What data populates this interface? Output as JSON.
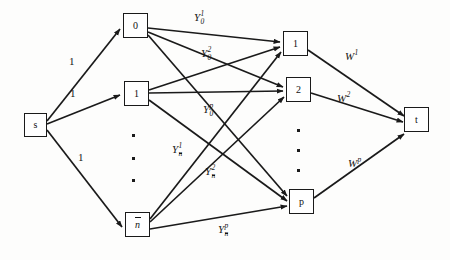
{
  "diagram": {
    "type": "flow-network-graph",
    "title": "",
    "canvas": {
      "width": 450,
      "height": 260
    },
    "stroke_color": "#1a1a1a",
    "background_color": "#fdfdfc",
    "nodes": [
      {
        "id": "s",
        "label": "s",
        "style": "upright",
        "overbar": false,
        "x": 24,
        "y": 113,
        "w": 23,
        "h": 24,
        "column": "source"
      },
      {
        "id": "m0",
        "label": "0",
        "style": "upright",
        "overbar": false,
        "x": 123,
        "y": 13,
        "w": 25,
        "h": 25,
        "column": "middle"
      },
      {
        "id": "m1",
        "label": "1",
        "style": "upright",
        "overbar": false,
        "x": 124,
        "y": 81,
        "w": 25,
        "h": 25,
        "column": "middle"
      },
      {
        "id": "mn",
        "label": "n",
        "style": "italic",
        "overbar": true,
        "x": 125,
        "y": 212,
        "w": 25,
        "h": 25,
        "column": "middle"
      },
      {
        "id": "r1",
        "label": "1",
        "style": "upright",
        "overbar": false,
        "x": 283,
        "y": 31,
        "w": 25,
        "h": 25,
        "column": "right"
      },
      {
        "id": "r2",
        "label": "2",
        "style": "upright",
        "overbar": false,
        "x": 286,
        "y": 77,
        "w": 25,
        "h": 25,
        "column": "right"
      },
      {
        "id": "rp",
        "label": "p",
        "style": "upright",
        "overbar": false,
        "x": 289,
        "y": 189,
        "w": 25,
        "h": 25,
        "column": "right"
      },
      {
        "id": "t",
        "label": "t",
        "style": "upright",
        "overbar": false,
        "x": 404,
        "y": 107,
        "w": 25,
        "h": 25,
        "column": "sink"
      }
    ],
    "source_edge_labels": [
      {
        "text": "1",
        "x": 69,
        "y": 56
      },
      {
        "text": "1",
        "x": 70,
        "y": 88
      },
      {
        "text": "1",
        "x": 78,
        "y": 152
      }
    ],
    "middle_edge_labels": [
      {
        "base": "Y",
        "sub": "0",
        "sub_overbar": false,
        "sup": "1",
        "x": 194,
        "y": 12
      },
      {
        "base": "Y",
        "sub": "0",
        "sub_overbar": false,
        "sup": "2",
        "x": 201,
        "y": 48
      },
      {
        "base": "Y",
        "sub": "0",
        "sub_overbar": false,
        "sup": "p",
        "x": 203,
        "y": 104
      },
      {
        "base": "Y",
        "sub": "n",
        "sub_overbar": true,
        "sup": "1",
        "x": 172,
        "y": 144
      },
      {
        "base": "Y",
        "sub": "n",
        "sub_overbar": true,
        "sup": "2",
        "x": 205,
        "y": 166
      },
      {
        "base": "Y",
        "sub": "n",
        "sub_overbar": true,
        "sup": "p",
        "x": 218,
        "y": 224
      }
    ],
    "sink_edge_labels": [
      {
        "base": "W",
        "sup": "1",
        "x": 345,
        "y": 51
      },
      {
        "base": "W",
        "sup": "2",
        "x": 337,
        "y": 93
      },
      {
        "base": "W",
        "sup": "p",
        "x": 348,
        "y": 158
      }
    ],
    "ellipsis_middle": [
      {
        "x": 132,
        "y": 134
      },
      {
        "x": 132,
        "y": 157
      },
      {
        "x": 132,
        "y": 179
      }
    ],
    "ellipsis_right": [
      {
        "x": 297,
        "y": 129
      },
      {
        "x": 297,
        "y": 149
      },
      {
        "x": 297,
        "y": 169
      }
    ],
    "edges": [
      {
        "from": "s",
        "to": "m0",
        "label": "1"
      },
      {
        "from": "s",
        "to": "m1",
        "label": "1"
      },
      {
        "from": "s",
        "to": "mn",
        "label": "1"
      },
      {
        "from": "m0",
        "to": "r1",
        "label": "Y_0^1"
      },
      {
        "from": "m0",
        "to": "r2",
        "label": "Y_0^2"
      },
      {
        "from": "m0",
        "to": "rp",
        "label": "Y_0^p"
      },
      {
        "from": "m1",
        "to": "r1",
        "label": ""
      },
      {
        "from": "m1",
        "to": "r2",
        "label": ""
      },
      {
        "from": "m1",
        "to": "rp",
        "label": ""
      },
      {
        "from": "mn",
        "to": "r1",
        "label": "Y_n^1"
      },
      {
        "from": "mn",
        "to": "r2",
        "label": "Y_n^2"
      },
      {
        "from": "mn",
        "to": "rp",
        "label": "Y_n^p"
      },
      {
        "from": "r1",
        "to": "t",
        "label": "W^1"
      },
      {
        "from": "r2",
        "to": "t",
        "label": "W^2"
      },
      {
        "from": "rp",
        "to": "t",
        "label": "W^p"
      }
    ]
  }
}
